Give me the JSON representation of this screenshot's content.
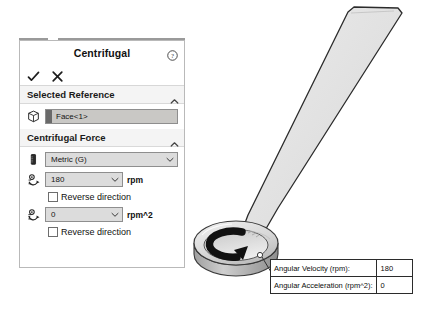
{
  "panel": {
    "title": "Centrifugal",
    "help_icon": "help-circle-icon",
    "confirm": {
      "ok_icon": "checkmark-icon",
      "cancel_icon": "close-x-icon"
    },
    "selected_reference": {
      "header": "Selected Reference",
      "collapse_icon": "chevron-up-icon",
      "face_icon": "cube-face-icon",
      "value": "Face<1>"
    },
    "centrifugal_force": {
      "header": "Centrifugal Force",
      "collapse_icon": "chevron-up-icon",
      "units": {
        "icon": "unit-ruler-icon",
        "value": "Metric (G)",
        "arrow_icon": "chevron-down-icon"
      },
      "angular_velocity": {
        "icon": "angular-velocity-icon",
        "value": "180",
        "unit": "rpm",
        "arrow_icon": "chevron-down-icon",
        "reverse_label": "Reverse direction",
        "reverse_checked": false
      },
      "angular_acceleration": {
        "icon": "angular-acceleration-icon",
        "value": "0",
        "unit": "rpm^2",
        "arrow_icon": "chevron-down-icon",
        "reverse_label": "Reverse direction",
        "reverse_checked": false
      }
    }
  },
  "viewport": {
    "blade_name": "propeller-blade-geometry",
    "hub_name": "rotation-hub-geometry",
    "rotation_arrow": "rotation-direction-arrow-icon",
    "leader_line": "callout-leader-line"
  },
  "callout": {
    "rows": [
      {
        "label": "Angular Velocity (rpm):",
        "value": "180"
      },
      {
        "label": "Angular Acceleration (rpm^2):",
        "value": "0"
      }
    ]
  },
  "colors": {
    "panel_border": "#b9b9b9",
    "section_bg": "#f4f4f4",
    "field_bg": "#dcdcdc",
    "selection_bg": "#c9c8c5",
    "geometry_fill": "#e2e2e2",
    "geometry_stroke": "#2b2b2b",
    "arrow_black": "#111111"
  }
}
